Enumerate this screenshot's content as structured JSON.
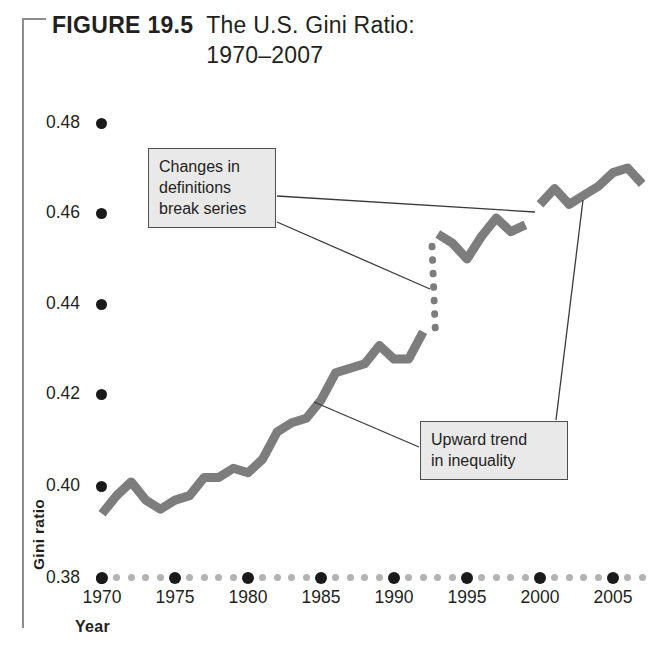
{
  "figure": {
    "label": "FIGURE  19.5",
    "title_line1": "The U.S. Gini Ratio:",
    "title_line2": "1970–2007"
  },
  "axes": {
    "x_title": "Year",
    "y_title": "Gini ratio",
    "y_ticks": [
      "0.38",
      "0.40",
      "0.42",
      "0.44",
      "0.46",
      "0.48"
    ],
    "x_ticks": [
      "1970",
      "1975",
      "1980",
      "1985",
      "1990",
      "1995",
      "2000",
      "2005"
    ]
  },
  "annotations": [
    {
      "name": "break-series-callout",
      "line1": "Changes in",
      "line2": "definitions",
      "line3": "break series"
    },
    {
      "name": "upward-trend-callout",
      "line1": "Upward trend",
      "line2": "in inequality"
    }
  ],
  "colors": {
    "line": "#7d7d7d",
    "text": "#231f20",
    "tick_major": "#1a1a1a",
    "tick_minor": "#b3b3b3",
    "callout_fill": "#e9e9e9",
    "callout_border": "#4d4d4d",
    "bracket": "#8d8d8d"
  },
  "chart_data": {
    "type": "line",
    "title": "The U.S. Gini Ratio: 1970–2007",
    "xlabel": "Year",
    "ylabel": "Gini ratio",
    "xlim": [
      1970,
      2007
    ],
    "ylim": [
      0.38,
      0.485
    ],
    "grid": false,
    "legend": "none",
    "notes": [
      "Series is broken between 1992 and 1993 by changes in definitions (vertical dotted connector).",
      "A second small break appears between 1999 and 2000."
    ],
    "series": [
      {
        "name": "Gini ratio (1970–1992 definitions)",
        "x": [
          1970,
          1971,
          1972,
          1973,
          1974,
          1975,
          1976,
          1977,
          1978,
          1979,
          1980,
          1981,
          1982,
          1983,
          1984,
          1985,
          1986,
          1987,
          1988,
          1989,
          1990,
          1991,
          1992
        ],
        "values": [
          0.394,
          0.398,
          0.401,
          0.397,
          0.395,
          0.397,
          0.398,
          0.402,
          0.402,
          0.404,
          0.403,
          0.406,
          0.412,
          0.414,
          0.415,
          0.419,
          0.425,
          0.426,
          0.427,
          0.431,
          0.428,
          0.428,
          0.434
        ]
      },
      {
        "name": "Gini ratio (1993–1999 definitions)",
        "x": [
          1993,
          1994,
          1995,
          1996,
          1997,
          1998,
          1999
        ],
        "values": [
          0.4555,
          0.4535,
          0.45,
          0.455,
          0.459,
          0.456,
          0.4575
        ]
      },
      {
        "name": "Gini ratio (2000–2007 definitions)",
        "x": [
          2000,
          2001,
          2002,
          2003,
          2004,
          2005,
          2006,
          2007
        ],
        "values": [
          0.462,
          0.4655,
          0.462,
          0.464,
          0.466,
          0.469,
          0.47,
          0.4665
        ]
      }
    ],
    "break_connector": {
      "from": {
        "x": 1992,
        "y": 0.434
      },
      "to": {
        "x": 1993,
        "y": 0.4555
      },
      "style": "dotted"
    }
  }
}
